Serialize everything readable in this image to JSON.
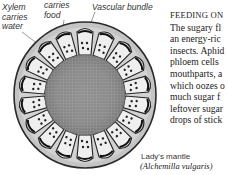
{
  "diagram": {
    "labels": {
      "xylem": "Xylem\ncarries\nwater",
      "phloem": "carries\nfood",
      "vascular_bundle": "Vascular bundle",
      "plant_common": "Lady's mantle",
      "plant_latin": "(Alchemilla vulgaris)"
    }
  },
  "article": {
    "heading": "FEEDING ON",
    "lines": [
      "The sugary fl",
      "an energy-ric",
      "insects. Aphid",
      "phloem cells",
      "mouthparts, a",
      "which oozes o",
      "much sugar f",
      "leftover sugar",
      "drops of stick"
    ]
  }
}
